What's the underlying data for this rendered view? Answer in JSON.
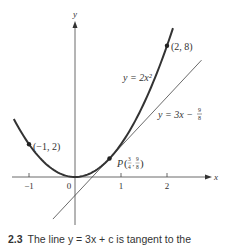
{
  "figure": {
    "axes": {
      "x_label": "x",
      "y_label": "y",
      "x_ticks": [
        {
          "value": -1,
          "label": "−1"
        },
        {
          "value": 0,
          "label": "0"
        },
        {
          "value": 1,
          "label": "1"
        },
        {
          "value": 2,
          "label": "2"
        }
      ]
    },
    "curve": {
      "label": "y = 2x²",
      "equation": "y = 2x^2",
      "x_range": [
        -1.33,
        2.13
      ]
    },
    "tangent": {
      "label_prefix": "y = 3x − ",
      "label_frac_num": "9",
      "label_frac_den": "8",
      "slope": 3,
      "intercept": -1.125,
      "x_range": [
        -0.48,
        2.75
      ]
    },
    "points": [
      {
        "x": -1,
        "y": 2,
        "label": "(−1, 2)"
      },
      {
        "x": 2,
        "y": 8,
        "label": "(2, 8)"
      },
      {
        "x": 0.75,
        "y": 1.125,
        "label": "P",
        "coord_x_num": "3",
        "coord_x_den": "4",
        "coord_y_num": "9",
        "coord_y_den": "8"
      }
    ],
    "colors": {
      "curve": "#333333",
      "line": "#444444",
      "axis": "#444444"
    }
  },
  "caption": {
    "number": "2.3",
    "text": "The line y = 3x + c is tangent to the"
  }
}
